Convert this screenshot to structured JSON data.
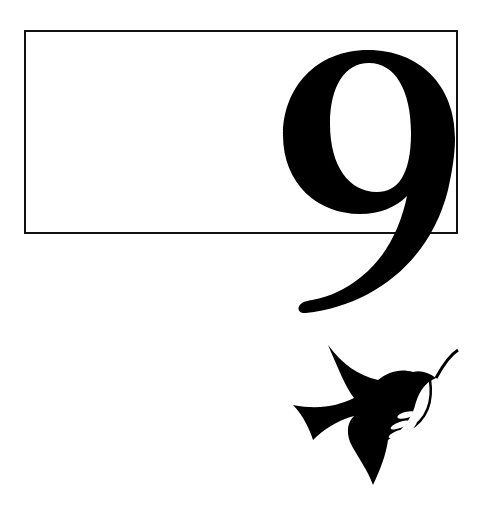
{
  "page": {
    "numeral": "9",
    "frame_color": "#111111",
    "ink_color": "#000000",
    "background": "#ffffff"
  },
  "icons": {
    "dove": "dove-with-olive-branch-icon"
  }
}
